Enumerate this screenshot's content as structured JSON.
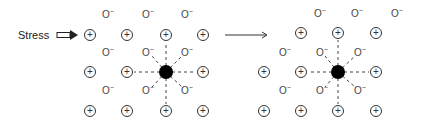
{
  "figure": {
    "stress_label": "Stress",
    "cation_symbol": "+",
    "anion_symbol": "O",
    "anion_charge": "−",
    "left_panel": {
      "plus_positions": [
        [
          90,
          35
        ],
        [
          127,
          35
        ],
        [
          166,
          35
        ],
        [
          203,
          35
        ],
        [
          90,
          72
        ],
        [
          127,
          72
        ],
        [
          203,
          72
        ],
        [
          90,
          111
        ],
        [
          127,
          111
        ],
        [
          166,
          111
        ],
        [
          203,
          111
        ]
      ],
      "anion_positions": [
        [
          108,
          14
        ],
        [
          148,
          14
        ],
        [
          187,
          14
        ],
        [
          108,
          52
        ],
        [
          148,
          52
        ],
        [
          187,
          52
        ],
        [
          108,
          90
        ],
        [
          148,
          90
        ],
        [
          187,
          90
        ]
      ],
      "dopant": [
        166,
        72
      ]
    },
    "right_panel": {
      "plus_positions": [
        [
          301,
          33
        ],
        [
          338,
          33
        ],
        [
          376,
          33
        ],
        [
          264,
          72
        ],
        [
          301,
          72
        ],
        [
          376,
          72
        ],
        [
          264,
          111
        ],
        [
          301,
          111
        ],
        [
          338,
          111
        ],
        [
          376,
          111
        ]
      ],
      "anion_positions": [
        [
          320,
          13
        ],
        [
          357,
          13
        ],
        [
          397,
          13
        ],
        [
          285,
          52
        ],
        [
          322,
          52
        ],
        [
          360,
          52
        ],
        [
          285,
          90
        ],
        [
          322,
          90
        ],
        [
          360,
          90
        ]
      ],
      "dopant": [
        338,
        72
      ]
    },
    "transition_arrow": "→"
  }
}
